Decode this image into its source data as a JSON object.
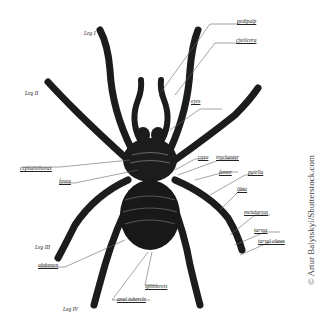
{
  "diagram": {
    "labels": {
      "leg_1": "Leg I",
      "leg_2": "Leg II",
      "leg_3": "Leg III",
      "leg_4": "Leg IV",
      "pedipalp": "pedipalp",
      "chelicera": "chelicera",
      "eyes": "eyes",
      "cephalothorax": "cephalothorax",
      "fovea": "fovea",
      "coxa": "coxa",
      "trochanter": "trochanter",
      "femur": "femur",
      "patella": "patella",
      "tibia": "tibia",
      "metatarsus": "metatarsus",
      "tarsus": "tarsus",
      "tarsal_claws": "tarsal claws",
      "abdomen": "abdomen",
      "spinnerets": "spinnerets",
      "anal_tubercle": "anal tubercle"
    },
    "credit": "© Artur Balytskyi/Shutterstock.com",
    "colors": {
      "ink": "#1a1a1a",
      "line": "#555555",
      "background": "#ffffff"
    }
  }
}
